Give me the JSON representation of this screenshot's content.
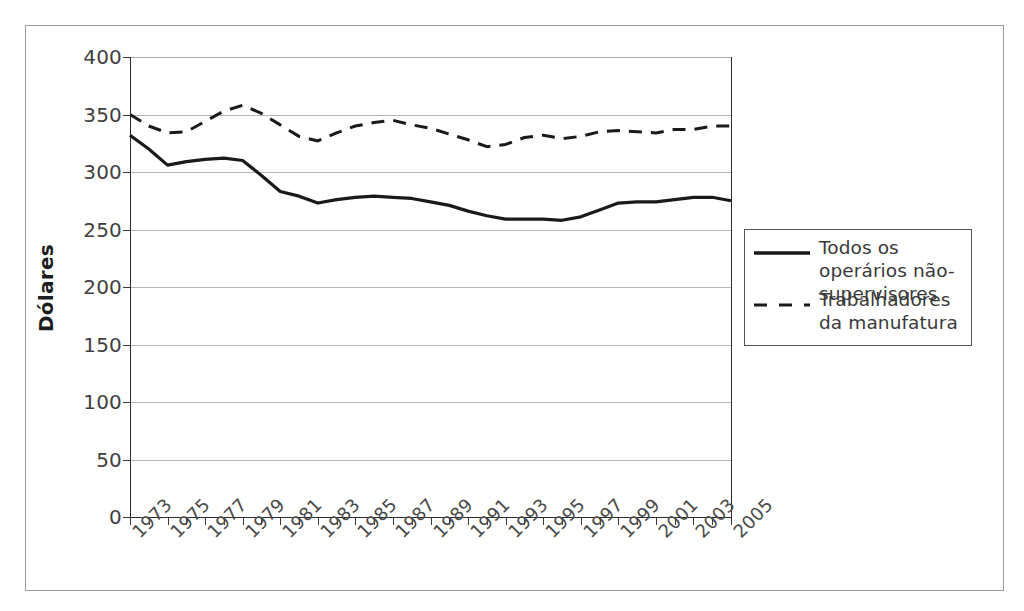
{
  "chart_data": {
    "type": "line",
    "title": "",
    "subtitle": "",
    "xlabel": "",
    "ylabel": "Dólares",
    "ylim": [
      0,
      400
    ],
    "ytick_step": 50,
    "yticks": [
      0,
      50,
      100,
      150,
      200,
      250,
      300,
      350,
      400
    ],
    "ytick_labels": [
      "0",
      "50",
      "100",
      "150",
      "200",
      "250",
      "300",
      "350",
      "400"
    ],
    "xlim": [
      1973,
      2005
    ],
    "x": [
      1973,
      1974,
      1975,
      1976,
      1977,
      1978,
      1979,
      1980,
      1981,
      1982,
      1983,
      1984,
      1985,
      1986,
      1987,
      1988,
      1989,
      1990,
      1991,
      1992,
      1993,
      1994,
      1995,
      1996,
      1997,
      1998,
      1999,
      2000,
      2001,
      2002,
      2003,
      2004,
      2005
    ],
    "xtick_labels": [
      "1973",
      "1975",
      "1977",
      "1979",
      "1981",
      "1983",
      "1985",
      "1987",
      "1989",
      "1991",
      "1993",
      "1995",
      "1997",
      "1999",
      "2001",
      "2003",
      "2005"
    ],
    "xtick_values": [
      1973,
      1975,
      1977,
      1979,
      1981,
      1983,
      1985,
      1987,
      1989,
      1991,
      1993,
      1995,
      1997,
      1999,
      2001,
      2003,
      2005
    ],
    "xtick_rotation": -45,
    "grid": true,
    "grid_axis": "y",
    "legend_position": "right",
    "series": [
      {
        "name": "Todos os operários não-supervisores",
        "style": "solid",
        "color": "#1a1a1a",
        "width": 3.2,
        "values": [
          332,
          320,
          306,
          309,
          311,
          312,
          310,
          297,
          283,
          279,
          273,
          276,
          278,
          279,
          278,
          277,
          274,
          271,
          266,
          262,
          259,
          259,
          259,
          258,
          261,
          267,
          273,
          274,
          274,
          276,
          278,
          278,
          275
        ]
      },
      {
        "name": "Trabalhadores da manufatura",
        "style": "dashed",
        "color": "#1a1a1a",
        "width": 3.0,
        "values": [
          350,
          340,
          334,
          335,
          344,
          353,
          358,
          351,
          341,
          331,
          327,
          334,
          340,
          343,
          345,
          341,
          338,
          333,
          328,
          322,
          324,
          330,
          332,
          329,
          331,
          335,
          336,
          335,
          334,
          337,
          337,
          340,
          340
        ]
      }
    ]
  },
  "legend": {
    "entries": [
      {
        "label": "Todos os operários não-supervisores",
        "style": "solid"
      },
      {
        "label": "Trabalhadores da manufatura",
        "style": "dashed"
      }
    ]
  },
  "axes": {
    "y_title": "Dólares"
  }
}
